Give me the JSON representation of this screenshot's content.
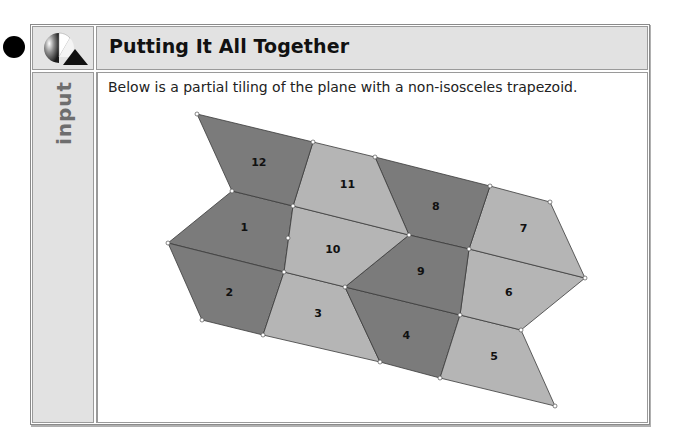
{
  "header": {
    "title": "Putting It All Together",
    "logo_icon": "circle-triangle-logo-icon"
  },
  "sidebar": {
    "label": "input"
  },
  "content": {
    "intro_text": "Below is a partial tiling of the plane with a non-isosceles trapezoid."
  },
  "colors": {
    "dark_tile": "#7b7b7b",
    "light_tile": "#b5b5b5"
  },
  "tiling": {
    "tiles": [
      {
        "label": "1",
        "shade": "dark"
      },
      {
        "label": "2",
        "shade": "dark"
      },
      {
        "label": "3",
        "shade": "light"
      },
      {
        "label": "4",
        "shade": "dark"
      },
      {
        "label": "5",
        "shade": "light"
      },
      {
        "label": "6",
        "shade": "light"
      },
      {
        "label": "7",
        "shade": "light"
      },
      {
        "label": "8",
        "shade": "dark"
      },
      {
        "label": "9",
        "shade": "dark"
      },
      {
        "label": "10",
        "shade": "light"
      },
      {
        "label": "11",
        "shade": "light"
      },
      {
        "label": "12",
        "shade": "dark"
      }
    ]
  }
}
